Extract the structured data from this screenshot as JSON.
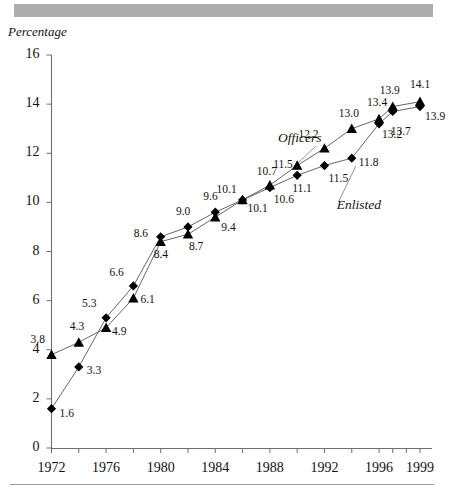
{
  "header": {
    "bar_color": "#adadad"
  },
  "axis_title": "Percentage",
  "series_labels": {
    "officers": "Officers",
    "enlisted": "Enlisted"
  },
  "chart_data": {
    "type": "line",
    "title": "",
    "subtitle": "",
    "xlabel": "",
    "ylabel": "Percentage",
    "xlim": [
      1972,
      1999
    ],
    "ylim": [
      0,
      16
    ],
    "yticks": [
      0,
      2,
      4,
      6,
      8,
      10,
      12,
      14,
      16
    ],
    "ytick_labels": [
      "0",
      "2",
      "4",
      "6",
      "8",
      "10",
      "12",
      "14",
      "16"
    ],
    "xticks": [
      1972,
      1974,
      1976,
      1978,
      1980,
      1982,
      1984,
      1986,
      1988,
      1990,
      1992,
      1994,
      1996,
      1997,
      1998,
      1999
    ],
    "xtick_labels": [
      "1972",
      "1976",
      "1980",
      "1984",
      "1988",
      "1992",
      "1996",
      "1999"
    ],
    "xtick_label_values": [
      1972,
      1976,
      1980,
      1984,
      1988,
      1992,
      1996,
      1999
    ],
    "grid": false,
    "legend_position": "inline-annotation",
    "series": [
      {
        "name": "Officers",
        "marker": "triangle",
        "color": "#000000",
        "x": [
          1972,
          1974,
          1976,
          1978,
          1980,
          1982,
          1984,
          1986,
          1988,
          1990,
          1992,
          1994,
          1996,
          1997,
          1999
        ],
        "values": [
          3.8,
          4.3,
          4.9,
          6.1,
          8.4,
          8.7,
          9.4,
          10.1,
          10.7,
          11.5,
          12.2,
          13.0,
          13.4,
          13.9,
          14.1
        ],
        "labels": [
          "3.8",
          "4.3",
          "4.9",
          "6.1",
          "8.4",
          "8.7",
          "9.4",
          "10.1",
          "10.7",
          "11.5",
          "12.2",
          "13.0",
          "13.4",
          "13.9",
          "14.1"
        ]
      },
      {
        "name": "Enlisted",
        "marker": "diamond",
        "color": "#000000",
        "x": [
          1972,
          1974,
          1976,
          1978,
          1980,
          1982,
          1984,
          1986,
          1988,
          1990,
          1992,
          1994,
          1996,
          1997,
          1999
        ],
        "values": [
          1.6,
          3.3,
          5.3,
          6.6,
          8.6,
          9.0,
          9.6,
          10.1,
          10.6,
          11.1,
          11.5,
          11.8,
          13.2,
          13.7,
          13.9
        ],
        "labels": [
          "1.6",
          "3.3",
          "5.3",
          "6.6",
          "8.6",
          "9.0",
          "9.6",
          "10.1",
          "10.6",
          "11.1",
          "11.5",
          "11.8",
          "13.2",
          "13.7",
          "13.9"
        ]
      }
    ],
    "annotations": [
      {
        "text": "Officers",
        "x": 1988.6,
        "y": 12.95
      },
      {
        "text": "Enlisted",
        "x": 1992.9,
        "y": 10.2
      }
    ]
  }
}
